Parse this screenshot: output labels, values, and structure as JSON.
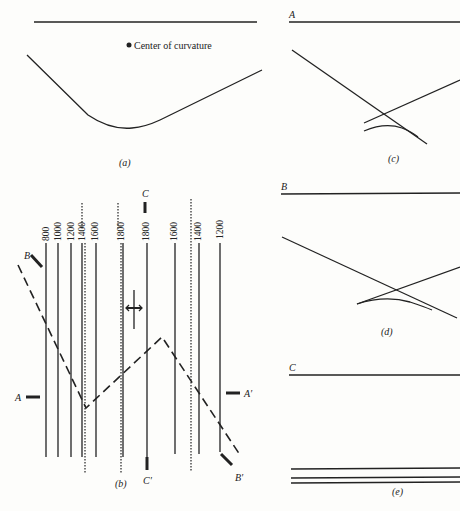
{
  "figure": {
    "panels": [
      {
        "id": "a",
        "caption": "(a)",
        "annotation": "Center of curvature"
      },
      {
        "id": "b",
        "caption": "(b)",
        "contour_labels": [
          "800",
          "1000",
          "1200",
          "1400",
          "1600",
          "1800",
          "1800",
          "1600",
          "1400",
          "1200"
        ],
        "section_labels": {
          "A": "A",
          "A_prime": "A′",
          "B": "B",
          "B_prime": "B′",
          "C": "C",
          "C_prime": "C′"
        }
      },
      {
        "id": "c",
        "caption": "(c)",
        "section_label": "A"
      },
      {
        "id": "d",
        "caption": "(d)",
        "section_label": "B"
      },
      {
        "id": "e",
        "caption": "(e)",
        "section_label": "C"
      }
    ]
  },
  "colors": {
    "ink": "#222222",
    "paper": "#fdfdfb"
  }
}
